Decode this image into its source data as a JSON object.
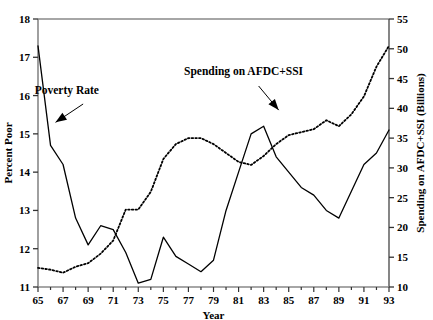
{
  "chart_data": {
    "type": "line",
    "title": "",
    "xlabel": "Year",
    "ylabel": "Percent Poor",
    "y2label": "Spending on AFDC+SSI (Billions)",
    "grid": false,
    "legend_position": "inline-annotations",
    "xlim": [
      65,
      93
    ],
    "ylim": [
      11,
      18
    ],
    "y2lim": [
      10,
      55
    ],
    "x": [
      65,
      66,
      67,
      68,
      69,
      70,
      71,
      72,
      73,
      74,
      75,
      76,
      77,
      78,
      79,
      80,
      81,
      82,
      83,
      84,
      85,
      86,
      87,
      88,
      89,
      90,
      91,
      92,
      93
    ],
    "xtick_labels": [
      "65",
      "67",
      "69",
      "71",
      "73",
      "75",
      "77",
      "79",
      "81",
      "83",
      "85",
      "87",
      "89",
      "91",
      "93"
    ],
    "xticks": [
      65,
      67,
      69,
      71,
      73,
      75,
      77,
      79,
      81,
      83,
      85,
      87,
      89,
      91,
      93
    ],
    "ytick_labels": [
      "11",
      "12",
      "13",
      "14",
      "15",
      "16",
      "17",
      "18"
    ],
    "yticks": [
      11,
      12,
      13,
      14,
      15,
      16,
      17,
      18
    ],
    "y2tick_labels": [
      "10",
      "15",
      "20",
      "25",
      "30",
      "35",
      "40",
      "45",
      "50",
      "55"
    ],
    "y2ticks": [
      10,
      15,
      20,
      25,
      30,
      35,
      40,
      45,
      50,
      55
    ],
    "series": [
      {
        "name": "Poverty Rate",
        "axis": "left",
        "style": "solid",
        "color": "#000000",
        "values": [
          17.3,
          14.7,
          14.2,
          12.8,
          12.1,
          12.6,
          12.5,
          11.9,
          11.1,
          11.2,
          12.3,
          11.8,
          11.6,
          11.4,
          11.7,
          13.0,
          14.0,
          15.0,
          15.2,
          14.4,
          14.0,
          13.6,
          13.4,
          13.0,
          12.8,
          13.5,
          14.2,
          14.5,
          15.1
        ]
      },
      {
        "name": "Spending on AFDC+SSI",
        "axis": "right",
        "style": "dotted",
        "color": "#000000",
        "values": [
          13.2,
          12.9,
          12.4,
          13.4,
          14.0,
          15.6,
          17.8,
          23.0,
          23.0,
          26.0,
          31.5,
          34.0,
          35.0,
          35.0,
          34.0,
          32.5,
          31.0,
          30.5,
          32.0,
          34.0,
          35.5,
          36.0,
          36.5,
          38.0,
          37.0,
          39.0,
          42.0,
          47.0,
          50.5
        ]
      }
    ],
    "annotations": [
      {
        "text": "Poverty Rate",
        "x": 67.3,
        "y": 16.05
      },
      {
        "text": "Spending on AFDC+SSI",
        "x": 81.4,
        "y": 16.55
      }
    ]
  }
}
